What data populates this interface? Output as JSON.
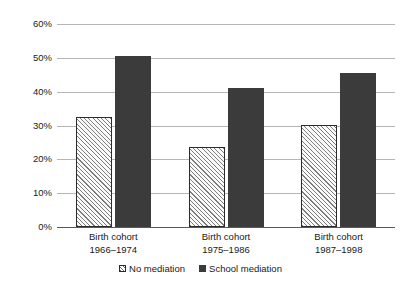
{
  "chart_data": {
    "type": "bar",
    "title": "",
    "subtitle": "",
    "xlabel": "",
    "ylabel": "",
    "categories": [
      "Birth cohort\n1966–1974",
      "Birth cohort\n1975–1986",
      "Birth cohort\n1987–1998"
    ],
    "category_lines": [
      {
        "line1": "Birth cohort",
        "line2": "1966–1974"
      },
      {
        "line1": "Birth cohort",
        "line2": "1975–1986"
      },
      {
        "line1": "Birth cohort",
        "line2": "1987–1998"
      }
    ],
    "series": [
      {
        "name": "No mediation",
        "values": [
          32.5,
          23.5,
          30.0
        ],
        "style": "hatched",
        "color": "#fafafa"
      },
      {
        "name": "School mediation",
        "values": [
          50.5,
          41.0,
          45.5
        ],
        "style": "solid",
        "color": "#3b3b3b"
      }
    ],
    "ylim": [
      0,
      60
    ],
    "ytick_values": [
      60,
      50,
      40,
      30,
      20,
      10,
      0
    ],
    "ytick_labels": [
      "60%",
      "50%",
      "40%",
      "30%",
      "20%",
      "10%",
      "0%"
    ],
    "grid": true,
    "legend_position": "bottom-center",
    "units": "percent"
  },
  "legend": {
    "items": [
      {
        "label": "No mediation",
        "swatch": "hatched-square-icon"
      },
      {
        "label": "School mediation",
        "swatch": "solid-square-icon"
      }
    ]
  },
  "colors": {
    "bar_solid": "#3b3b3b",
    "bar_hatch_line": "#7d7d7d",
    "bar_outline": "#2b2b2b",
    "gridline": "#b5b5b5",
    "axis": "#5a5a5a",
    "text": "#1a1a1a",
    "background": "#ffffff"
  }
}
